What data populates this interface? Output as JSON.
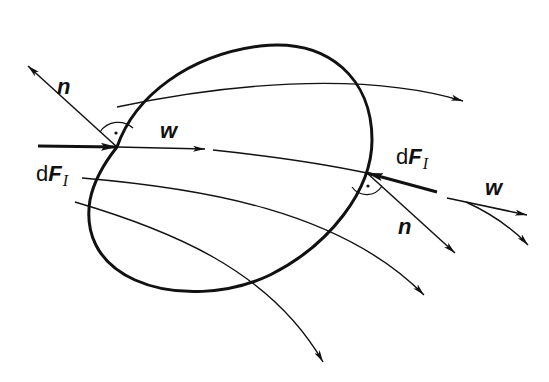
{
  "diagram": {
    "colors": {
      "stroke": "#111111",
      "background": "#ffffff"
    },
    "labels": {
      "n_left": "n",
      "w_left": "w",
      "dF_left_d": "d",
      "dF_left_F": "F",
      "dF_left_sub": "I",
      "dF_right_d": "d",
      "dF_right_F": "F",
      "dF_right_sub": "I",
      "n_right": "n",
      "w_right": "w"
    },
    "elements": {
      "control_surface": "closed boundary curve",
      "streamlines": 4,
      "right_angle_markers": 2
    }
  }
}
